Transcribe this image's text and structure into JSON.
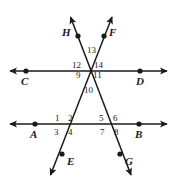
{
  "figure": {
    "type": "geometry-diagram",
    "width": 177,
    "height": 189,
    "line_color": "#1a1a1a",
    "background_color": "#ffffff",
    "points": [
      {
        "id": "C",
        "label": "C",
        "x": 26,
        "y": 71,
        "label_x": 21,
        "label_y": 76
      },
      {
        "id": "D",
        "label": "D",
        "x": 140,
        "y": 71,
        "label_x": 136,
        "label_y": 76
      },
      {
        "id": "A",
        "label": "A",
        "x": 35,
        "y": 124,
        "label_x": 30,
        "label_y": 129
      },
      {
        "id": "B",
        "label": "B",
        "x": 139,
        "y": 124,
        "label_x": 135,
        "label_y": 129
      },
      {
        "id": "H",
        "label": "H",
        "x": 78,
        "y": 32,
        "label_x": 62,
        "label_y": 27
      },
      {
        "id": "F",
        "label": "F",
        "x": 104,
        "y": 32,
        "label_x": 109,
        "label_y": 27
      },
      {
        "id": "E",
        "label": "E",
        "x": 62,
        "y": 157,
        "label_x": 67,
        "label_y": 156
      },
      {
        "id": "G",
        "label": "G",
        "x": 120,
        "y": 157,
        "label_x": 125,
        "label_y": 156
      }
    ],
    "lines": [
      {
        "id": "CD",
        "kind": "horizontal",
        "from": "C",
        "to": "D",
        "arrows": "both"
      },
      {
        "id": "AB",
        "kind": "horizontal",
        "from": "A",
        "to": "B",
        "arrows": "both"
      },
      {
        "id": "HG",
        "kind": "transversal",
        "from": "H",
        "to": "G",
        "arrows": "both"
      },
      {
        "id": "FE",
        "kind": "transversal",
        "from": "F",
        "to": "E",
        "arrows": "both"
      }
    ],
    "angles": [
      {
        "number": "1",
        "x": 55,
        "y": 114
      },
      {
        "number": "2",
        "x": 68,
        "y": 114
      },
      {
        "number": "3",
        "x": 54,
        "y": 128
      },
      {
        "number": "4",
        "x": 68,
        "y": 128
      },
      {
        "number": "5",
        "x": 99,
        "y": 114
      },
      {
        "number": "6",
        "x": 113,
        "y": 114
      },
      {
        "number": "7",
        "x": 100,
        "y": 128
      },
      {
        "number": "8",
        "x": 114,
        "y": 128
      },
      {
        "number": "9",
        "x": 76,
        "y": 71
      },
      {
        "number": "10",
        "x": 84,
        "y": 86
      },
      {
        "number": "11",
        "x": 93,
        "y": 71
      },
      {
        "number": "12",
        "x": 74,
        "y": 61
      },
      {
        "number": "13",
        "x": 87,
        "y": 46
      },
      {
        "number": "14",
        "x": 94,
        "y": 61
      }
    ]
  }
}
